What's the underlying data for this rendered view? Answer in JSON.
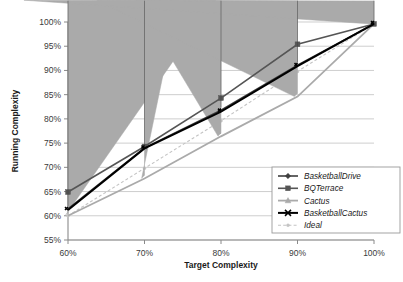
{
  "chart_data": {
    "type": "line",
    "title": "",
    "xlabel": "Target Complexity",
    "ylabel": "Running Complexity",
    "x": [
      60,
      70,
      80,
      90,
      100
    ],
    "xticklabels": [
      "60%",
      "70%",
      "80%",
      "90%",
      "100%"
    ],
    "yticklabels": [
      "55%",
      "60%",
      "65%",
      "70%",
      "75%",
      "80%",
      "85%",
      "90%",
      "95%",
      "100%"
    ],
    "yticks": [
      55,
      60,
      65,
      70,
      75,
      80,
      85,
      90,
      95,
      100
    ],
    "xlim": [
      60,
      100
    ],
    "ylim": [
      55,
      100
    ],
    "grid": "horizontal",
    "legend_position": "lower-right",
    "series": [
      {
        "name": "BasketballDrive",
        "values": [
          61.4,
          74.0,
          81.8,
          91.1,
          99.6
        ],
        "color": "#3f3f3f",
        "marker": "diamond",
        "dashed": false,
        "width": 1.6
      },
      {
        "name": "BQTerrace",
        "values": [
          64.9,
          74.3,
          84.3,
          95.4,
          99.6
        ],
        "color": "#555555",
        "marker": "square",
        "dashed": false,
        "width": 1.6
      },
      {
        "name": "Cactus",
        "values": [
          60.0,
          67.7,
          76.4,
          84.6,
          99.6
        ],
        "color": "#aaaaaa",
        "marker": "triangle",
        "dashed": false,
        "width": 1.8
      },
      {
        "name": "BasketballCactus",
        "values": [
          61.2,
          73.9,
          81.5,
          90.9,
          99.6
        ],
        "color": "#000000",
        "marker": "cross",
        "dashed": false,
        "width": 2.0
      },
      {
        "name": "Ideal",
        "values": [
          60.0,
          69.8,
          79.6,
          89.8,
          99.6
        ],
        "color": "#c4c4c4",
        "marker": "dot",
        "dashed": true,
        "width": 1.1
      }
    ]
  },
  "axis": {
    "x_title": "Target Complexity",
    "y_title": "Running Complexity"
  },
  "legend": {
    "items": [
      {
        "label": "BasketballDrive"
      },
      {
        "label": "BQTerrace"
      },
      {
        "label": "Cactus"
      },
      {
        "label": "BasketballCactus"
      },
      {
        "label": "Ideal"
      }
    ]
  },
  "colors": {
    "gridline": "#b9b9b9",
    "axis": "#8a8a8a",
    "background": "#ffffff",
    "legend_border": "#9a9a9a"
  }
}
